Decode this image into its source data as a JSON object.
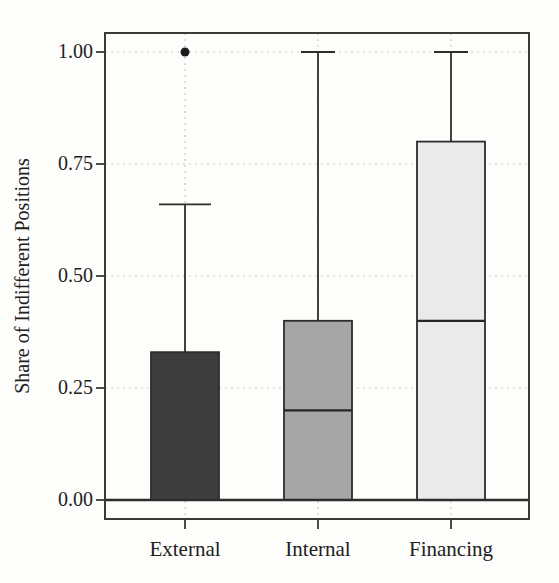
{
  "chart_data": {
    "type": "boxplot",
    "title": "",
    "xlabel": "",
    "ylabel": "Share of Indifferent Positions",
    "ylim": [
      -0.04,
      1.04
    ],
    "yticks": [
      0.0,
      0.25,
      0.5,
      0.75,
      1.0
    ],
    "ytick_labels": [
      "0.00",
      "0.25",
      "0.50",
      "0.75",
      "1.00"
    ],
    "categories": [
      "External",
      "Internal",
      "Financing"
    ],
    "grid": "dotted light-gray horizontal lines at y ticks and vertical lines at category centers",
    "legend": "none",
    "zero_line": true,
    "series": [
      {
        "category": "External",
        "whisker_low": 0.0,
        "q1": 0.0,
        "median": 0.0,
        "q3": 0.33,
        "whisker_high": 0.66,
        "outliers": [
          1.0
        ],
        "fill": "#3d3d3d"
      },
      {
        "category": "Internal",
        "whisker_low": 0.0,
        "q1": 0.0,
        "median": 0.2,
        "q3": 0.4,
        "whisker_high": 1.0,
        "outliers": [],
        "fill": "#a6a6a6"
      },
      {
        "category": "Financing",
        "whisker_low": 0.0,
        "q1": 0.0,
        "median": 0.4,
        "q3": 0.8,
        "whisker_high": 1.0,
        "outliers": [],
        "fill": "#eaeaea"
      }
    ],
    "colors": {
      "frame_stroke": "#3a3936",
      "box_stroke": "#2e2d2b",
      "whisker_stroke": "#2e2d2b",
      "median_stroke": "#262523",
      "zero_line": "#2e2d2b",
      "gridline": "#cccbc8",
      "outlier_fill": "#1e1d1c",
      "text": "#222120",
      "background": "#fdfdfc"
    }
  }
}
